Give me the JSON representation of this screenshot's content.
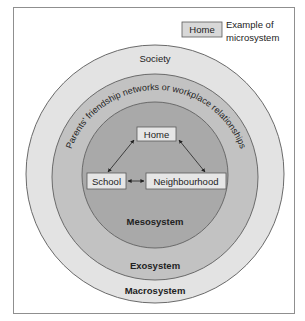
{
  "legend": {
    "box_label": "Home",
    "text_line1": "Example of",
    "text_line2": "microsystem"
  },
  "rings": {
    "outer": {
      "top_label": "Society",
      "bottom_label": "Macrosystem",
      "color": "#e3e3e3"
    },
    "middle": {
      "curved_label": "Parents' friendship networks or workplace relationships",
      "bottom_label": "Exosystem",
      "color": "#c2c2c2"
    },
    "inner": {
      "bottom_label": "Mesosystem",
      "color": "#a9a9a9"
    }
  },
  "microsystems": [
    {
      "label": "Home"
    },
    {
      "label": "School"
    },
    {
      "label": "Neighbourhood"
    }
  ],
  "colors": {
    "stroke": "#5a5a5a",
    "box_fill": "#e6e6e6",
    "text": "#222222"
  }
}
